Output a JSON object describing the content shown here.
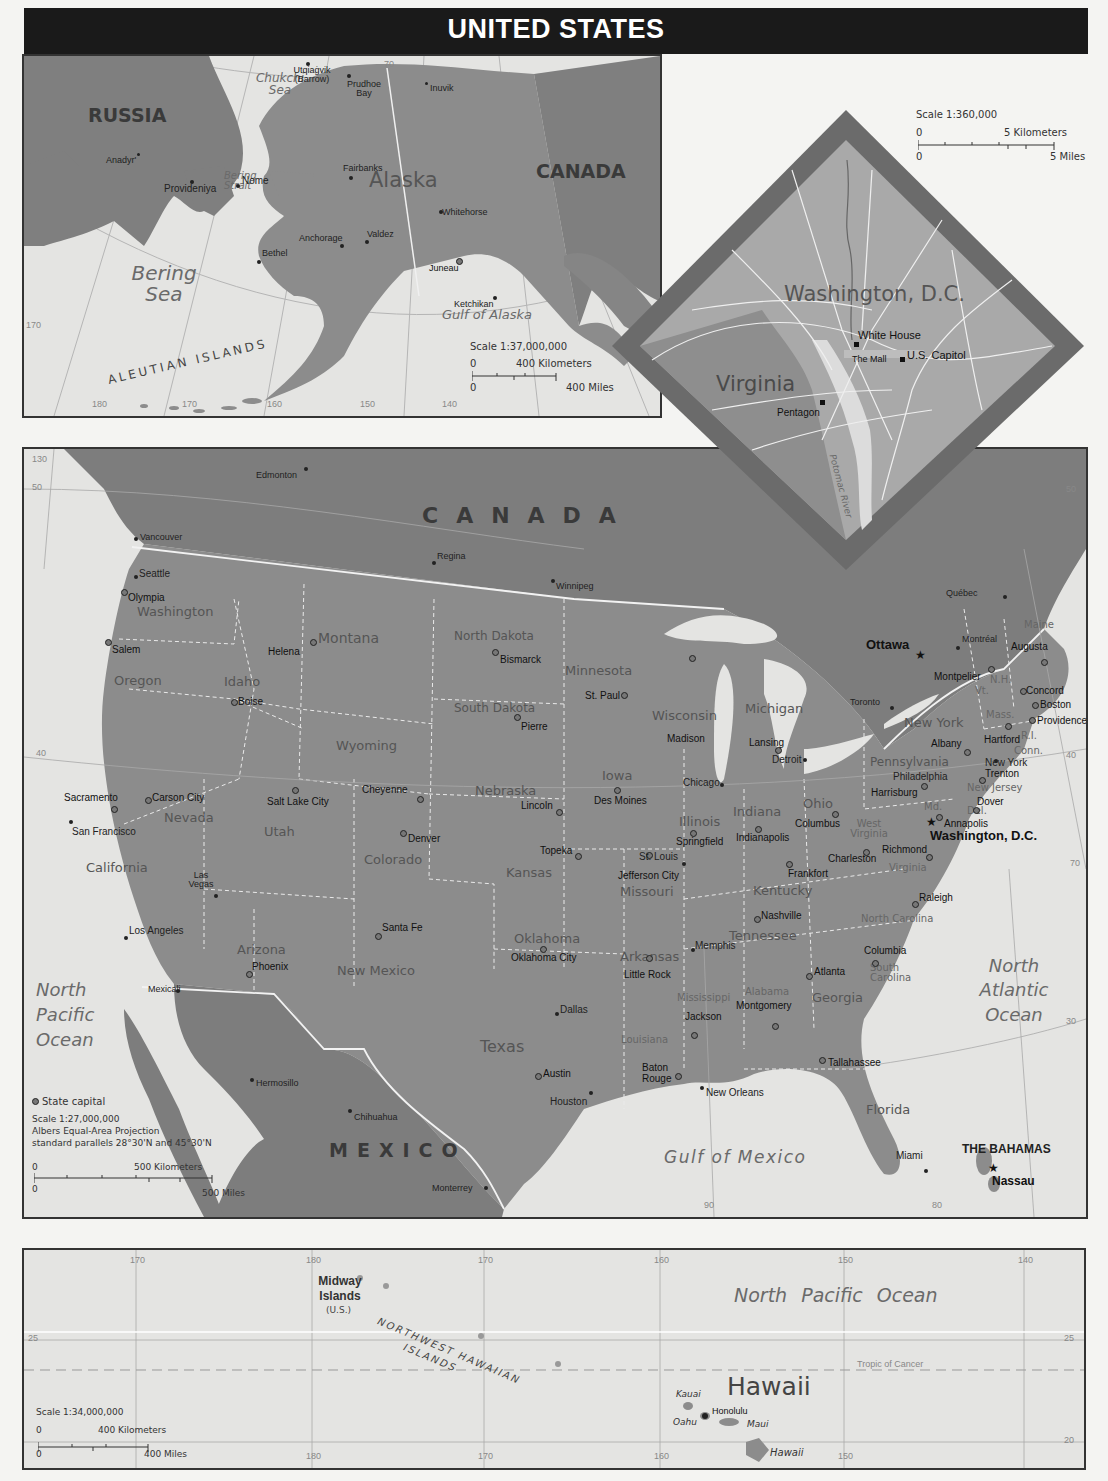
{
  "title": "UNITED STATES",
  "colors": {
    "title_bar": "#1a1a1a",
    "land_us": "#8c8c8c",
    "land_foreign": "#7d7d7d",
    "water": "#e4e4e2",
    "state_border": "#e8e8e8",
    "frame": "#333333",
    "dc_frame": "#6b6b6b"
  },
  "alaska_inset": {
    "region_label": "Alaska",
    "countries": [
      "RUSSIA",
      "CANADA"
    ],
    "water": [
      "Chukchi Sea",
      "Bering Sea",
      "Bering Strait",
      "Gulf of Alaska"
    ],
    "islands_label": "ALEUTIAN ISLANDS",
    "cities": [
      "Utqiaġvik (Barrow)",
      "Prudhoe Bay",
      "Inuvik",
      "Anadyr'",
      "Provideniya",
      "Nome",
      "Fairbanks",
      "Whitehorse",
      "Anchorage",
      "Valdez",
      "Bethel",
      "Juneau",
      "Ketchikan"
    ],
    "grid_labels": [
      "70",
      "170",
      "180",
      "170",
      "160",
      "150",
      "140"
    ],
    "scale": {
      "ratio": "Scale 1:37,000,000",
      "km_zero": "0",
      "km_label": "400 Kilometers",
      "mi_zero": "0",
      "mi_label": "400 Miles"
    }
  },
  "dc_inset": {
    "region_label": "Washington, D.C.",
    "state_label": "Virginia",
    "landmarks": [
      "White House",
      "The Mall",
      "U.S. Capitol",
      "Pentagon"
    ],
    "river": "Potomac River",
    "scale": {
      "ratio": "Scale 1:360,000",
      "km_zero": "0",
      "km_label": "5 Kilometers",
      "mi_zero": "0",
      "mi_label": "5 Miles"
    }
  },
  "main_map": {
    "countries": [
      "CANADA",
      "MEXICO",
      "THE BAHAMAS"
    ],
    "water": [
      "North Pacific Ocean",
      "North Atlantic Ocean",
      "Gulf of Mexico"
    ],
    "grid_labels": {
      "lon": [
        "130",
        "90",
        "80"
      ],
      "lat": [
        "50",
        "40",
        "30",
        "50",
        "40",
        "70"
      ]
    },
    "national_capitals": [
      "Ottawa",
      "Washington, D.C.",
      "Nassau"
    ],
    "foreign_cities": [
      "Edmonton",
      "Vancouver",
      "Regina",
      "Winnipeg",
      "Québec",
      "Montréal",
      "Toronto",
      "Hermosillo",
      "Chihuahua",
      "Monterrey",
      "Mexicali"
    ],
    "states": [
      "Washington",
      "Oregon",
      "California",
      "Nevada",
      "Idaho",
      "Montana",
      "Wyoming",
      "Utah",
      "Colorado",
      "Arizona",
      "New Mexico",
      "North Dakota",
      "South Dakota",
      "Nebraska",
      "Kansas",
      "Oklahoma",
      "Texas",
      "Minnesota",
      "Iowa",
      "Missouri",
      "Arkansas",
      "Louisiana",
      "Wisconsin",
      "Illinois",
      "Michigan",
      "Indiana",
      "Ohio",
      "Kentucky",
      "Tennessee",
      "Mississippi",
      "Alabama",
      "Georgia",
      "Florida",
      "South Carolina",
      "North Carolina",
      "Virginia",
      "West Virginia",
      "Pennsylvania",
      "New York",
      "Maine",
      "N.H.",
      "Vt.",
      "Mass.",
      "R.I.",
      "Conn.",
      "New Jersey",
      "Del.",
      "Md."
    ],
    "state_capitals": [
      "Olympia",
      "Salem",
      "Sacramento",
      "Carson City",
      "Boise",
      "Helena",
      "Salt Lake City",
      "Cheyenne",
      "Denver",
      "Phoenix",
      "Santa Fe",
      "Bismarck",
      "Pierre",
      "Lincoln",
      "Topeka",
      "Oklahoma City",
      "Austin",
      "St. Paul",
      "Des Moines",
      "Jefferson City",
      "Little Rock",
      "Baton Rouge",
      "Madison",
      "Springfield",
      "Lansing",
      "Indianapolis",
      "Columbus",
      "Frankfort",
      "Nashville",
      "Jackson",
      "Montgomery",
      "Atlanta",
      "Tallahassee",
      "Columbia",
      "Raleigh",
      "Richmond",
      "Charleston",
      "Harrisburg",
      "Albany",
      "Augusta",
      "Montpelier",
      "Concord",
      "Boston",
      "Providence",
      "Hartford",
      "Trenton",
      "Dover",
      "Annapolis"
    ],
    "other_cities": [
      "Seattle",
      "San Francisco",
      "Los Angeles",
      "Las Vegas",
      "Dallas",
      "Houston",
      "Chicago",
      "Detroit",
      "St. Louis",
      "Memphis",
      "New Orleans",
      "Miami",
      "Philadelphia",
      "New York"
    ],
    "legend": {
      "symbol_label": "State capital",
      "scale_ratio": "Scale 1:27,000,000",
      "projection": "Albers Equal-Area Projection",
      "parallels": "standard parallels 28°30'N and 45°30'N",
      "km_zero": "0",
      "km_label": "500 Kilometers",
      "mi_zero": "0",
      "mi_label": "500 Miles"
    }
  },
  "hawaii_inset": {
    "region_label": "Hawaii",
    "water": "North Pacific Ocean",
    "midway": {
      "name": "Midway Islands",
      "note": "(U.S.)"
    },
    "chain_label_1": "NORTHWEST HAWAIIAN",
    "chain_label_2": "ISLANDS",
    "tropic": "Tropic of Cancer",
    "islands": [
      "Kauai",
      "Oahu",
      "Maui",
      "Hawaii"
    ],
    "capital": "Honolulu",
    "grid_labels": {
      "top": [
        "170",
        "180",
        "170",
        "160",
        "150",
        "140"
      ],
      "bottom": [
        "180",
        "170",
        "160",
        "150"
      ],
      "lat": [
        "25",
        "20",
        "25"
      ]
    },
    "scale": {
      "ratio": "Scale 1:34,000,000",
      "km_zero": "0",
      "km_label": "400 Kilometers",
      "mi_zero": "0",
      "mi_label": "400 Miles"
    }
  }
}
